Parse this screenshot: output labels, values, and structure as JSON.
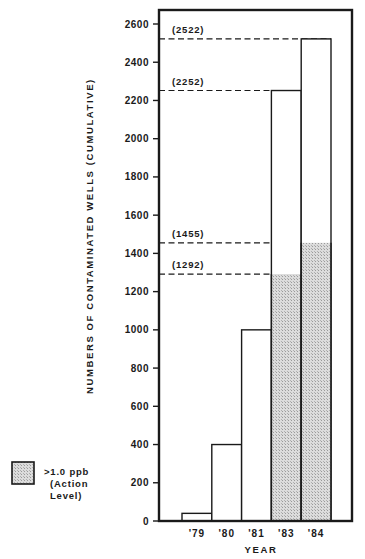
{
  "chart_data": {
    "type": "bar",
    "title": "",
    "xlabel": "YEAR",
    "ylabel": "NUMBERS OF CONTAMINATED WELLS (CUMULATIVE)",
    "categories": [
      "'79",
      "'80",
      "'81",
      "'83",
      "'84"
    ],
    "series": [
      {
        "name": "Total contaminated wells (cumulative)",
        "values": [
          40,
          400,
          1000,
          2252,
          2522
        ],
        "fill": "#ffffff"
      },
      {
        "name": ">1.0 ppb (Action Level)",
        "values": [
          0,
          0,
          0,
          1292,
          1455
        ],
        "fill": "#d4d4d4"
      }
    ],
    "ylim": [
      0,
      2600
    ],
    "yticks": [
      0,
      200,
      400,
      600,
      800,
      1000,
      1200,
      1400,
      1600,
      1800,
      2000,
      2200,
      2400,
      2600
    ],
    "grid": false,
    "annotations": [
      {
        "label": "(2522)",
        "value": 2522
      },
      {
        "label": "(2252)",
        "value": 2252
      },
      {
        "label": "(1455)",
        "value": 1455
      },
      {
        "label": "(1292)",
        "value": 1292
      }
    ],
    "legend": {
      "position": "bottom-left",
      "entries": [
        {
          "swatch": "shaded",
          "lines": [
            ">1.0 ppb",
            "(Action",
            "Level)"
          ]
        }
      ]
    }
  }
}
